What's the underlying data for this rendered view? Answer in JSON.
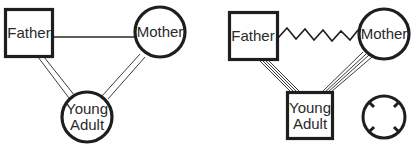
{
  "diagrams": [
    {
      "id": "left",
      "nodes": {
        "father": {
          "label": "Father",
          "shape": "square"
        },
        "mother": {
          "label": "Mother",
          "shape": "circle"
        },
        "young_adult": {
          "label_line1": "Young",
          "label_line2": "Adult",
          "shape": "circle"
        }
      },
      "edges": [
        {
          "from": "father",
          "to": "mother",
          "style": "single-line"
        },
        {
          "from": "father",
          "to": "young_adult",
          "style": "double-line"
        },
        {
          "from": "mother",
          "to": "young_adult",
          "style": "double-line"
        }
      ]
    },
    {
      "id": "right",
      "nodes": {
        "father": {
          "label": "Father",
          "shape": "square"
        },
        "mother": {
          "label": "Mother",
          "shape": "circle"
        },
        "young_adult": {
          "label_line1": "Young",
          "label_line2": "Adult",
          "shape": "square"
        }
      },
      "edges": [
        {
          "from": "father",
          "to": "mother",
          "style": "zigzag-conflict"
        },
        {
          "from": "father",
          "to": "young_adult",
          "style": "quadruple-line"
        },
        {
          "from": "mother",
          "to": "young_adult",
          "style": "quadruple-line"
        }
      ],
      "symbol": {
        "name": "circle-with-inward-ticks",
        "icon": "cutoff-icon"
      }
    }
  ],
  "colors": {
    "stroke": "#1e1e1e",
    "text": "#2a2a2a",
    "background": "#ffffff"
  }
}
